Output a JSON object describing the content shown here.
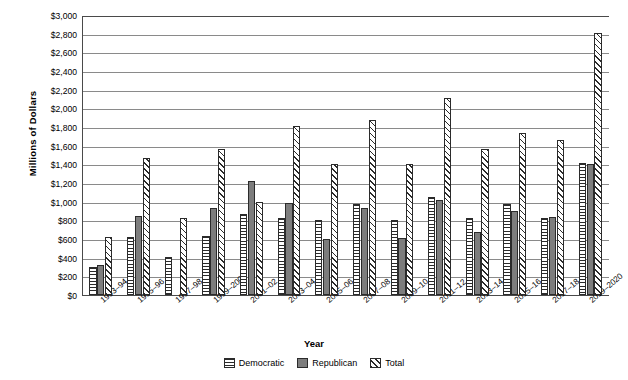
{
  "chart_data": {
    "type": "bar",
    "title": "",
    "xlabel": "Year",
    "ylabel": "Millions of Dollars",
    "ylim": [
      0,
      3000
    ],
    "ytick_step": 200,
    "ytick_labels": [
      "$3,000",
      "$2,800",
      "$2,600",
      "$2,400",
      "$2,200",
      "$2,000",
      "$1,800",
      "$1,600",
      "$1,400",
      "$1,200",
      "$1,000",
      "$800",
      "$600",
      "$400",
      "$200",
      "$0"
    ],
    "grid": true,
    "legend_position": "bottom",
    "categories": [
      "1993–94",
      "1995–96",
      "1997–98",
      "1999–2000",
      "2001–02",
      "2003–04",
      "2005–06",
      "2007–08",
      "2009–10",
      "2011–12",
      "2013–14",
      "2015–16",
      "2017–18",
      "2019–2020"
    ],
    "series": [
      {
        "name": "Democratic",
        "pattern": "horizontal-stripes",
        "color": "#ffffff",
        "values": [
          300,
          620,
          410,
          630,
          870,
          820,
          800,
          970,
          800,
          1050,
          820,
          980,
          830,
          1410
        ]
      },
      {
        "name": "Republican",
        "pattern": "solid-gray",
        "color": "#7d7d7d",
        "values": [
          320,
          850,
          0,
          930,
          1220,
          990,
          600,
          930,
          610,
          1020,
          680,
          900,
          840,
          1400
        ]
      },
      {
        "name": "Total",
        "pattern": "diagonal-hatch",
        "color": "#ffffff",
        "values": [
          620,
          1470,
          820,
          1560,
          1000,
          1810,
          1400,
          1880,
          1400,
          2110,
          1560,
          1740,
          1660,
          2810
        ]
      }
    ]
  },
  "legend": {
    "items": [
      {
        "label": "Democratic",
        "swatch": "dem"
      },
      {
        "label": "Republican",
        "swatch": "rep"
      },
      {
        "label": "Total",
        "swatch": "tot"
      }
    ]
  }
}
